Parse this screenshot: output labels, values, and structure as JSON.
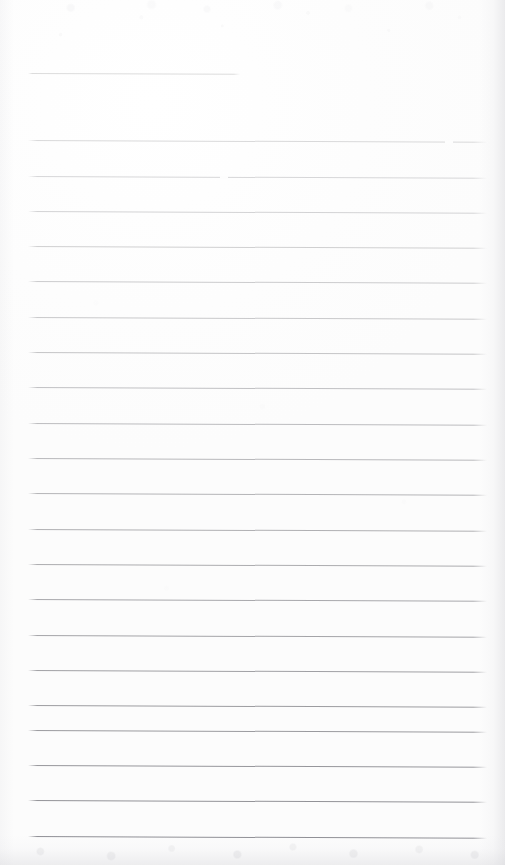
{
  "document": {
    "kind": "scanned-ruled-notepaper",
    "title": "Blank Ruled Notepaper (Scan)",
    "page_width": 505,
    "page_height": 865,
    "written_content": "",
    "paper_color": "#fdfdfd",
    "page_background": "#ffffff"
  },
  "ruling": {
    "left_margin_x": 28,
    "right_margin_x": 487,
    "line_spacing": 35.4,
    "tilt_degrees": 0.22,
    "short_first_rule_right_x": 240,
    "line_count": 23,
    "ink_color_top": "#d9d9d9",
    "ink_color_bottom": "#949496",
    "lines": [
      {
        "index": 1,
        "y": 73,
        "x1": 28,
        "x2": 240,
        "color": "#d6d6d6",
        "opacity": 0.85
      },
      {
        "index": 2,
        "y": 140,
        "x1": 28,
        "x2": 487,
        "color": "#d4d4d5",
        "opacity": 0.88
      },
      {
        "index": 3,
        "y": 176,
        "x1": 28,
        "x2": 487,
        "color": "#d2d2d4",
        "opacity": 0.9
      },
      {
        "index": 4,
        "y": 211,
        "x1": 28,
        "x2": 487,
        "color": "#cfcfd1",
        "opacity": 0.92
      },
      {
        "index": 5,
        "y": 246,
        "x1": 28,
        "x2": 487,
        "color": "#cccccd",
        "opacity": 0.93
      },
      {
        "index": 6,
        "y": 281,
        "x1": 28,
        "x2": 487,
        "color": "#c8c8ca",
        "opacity": 0.94
      },
      {
        "index": 7,
        "y": 317,
        "x1": 28,
        "x2": 487,
        "color": "#c5c5c7",
        "opacity": 0.94
      },
      {
        "index": 8,
        "y": 352,
        "x1": 28,
        "x2": 487,
        "color": "#c1c1c3",
        "opacity": 0.95
      },
      {
        "index": 9,
        "y": 387,
        "x1": 28,
        "x2": 487,
        "color": "#bdbdc0",
        "opacity": 0.95
      },
      {
        "index": 10,
        "y": 423,
        "x1": 28,
        "x2": 487,
        "color": "#b9b9bc",
        "opacity": 0.96
      },
      {
        "index": 11,
        "y": 458,
        "x1": 28,
        "x2": 487,
        "color": "#b5b5b8",
        "opacity": 0.96
      },
      {
        "index": 12,
        "y": 493,
        "x1": 28,
        "x2": 487,
        "color": "#b1b1b4",
        "opacity": 0.96
      },
      {
        "index": 13,
        "y": 529,
        "x1": 28,
        "x2": 487,
        "color": "#adadb0",
        "opacity": 0.97
      },
      {
        "index": 14,
        "y": 564,
        "x1": 28,
        "x2": 487,
        "color": "#a9a9ac",
        "opacity": 0.97
      },
      {
        "index": 15,
        "y": 599,
        "x1": 28,
        "x2": 487,
        "color": "#a5a5a9",
        "opacity": 0.97
      },
      {
        "index": 16,
        "y": 635,
        "x1": 28,
        "x2": 487,
        "color": "#a2a2a6",
        "opacity": 0.98
      },
      {
        "index": 17,
        "y": 670,
        "x1": 28,
        "x2": 487,
        "color": "#9e9ea2",
        "opacity": 0.98
      },
      {
        "index": 18,
        "y": 705,
        "x1": 28,
        "x2": 487,
        "color": "#9a9a9e",
        "opacity": 0.98
      },
      {
        "index": 19,
        "y": 730,
        "x1": 28,
        "x2": 487,
        "color": "#98989c",
        "opacity": 0.98
      },
      {
        "index": 20,
        "y": 765,
        "x1": 28,
        "x2": 487,
        "color": "#95959a",
        "opacity": 0.99
      },
      {
        "index": 21,
        "y": 800,
        "x1": 28,
        "x2": 487,
        "color": "#919196",
        "opacity": 0.99
      },
      {
        "index": 22,
        "y": 836,
        "x1": 28,
        "x2": 487,
        "color": "#8d8d93",
        "opacity": 1.0
      }
    ],
    "scan_breaks": [
      {
        "on_line_index": 2,
        "x": 445,
        "width": 8
      },
      {
        "on_line_index": 3,
        "x": 220,
        "width": 8
      }
    ]
  }
}
